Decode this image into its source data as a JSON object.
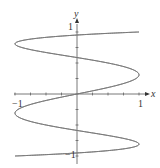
{
  "chart_data": {
    "type": "line",
    "title": "",
    "xlabel": "x",
    "ylabel": "y",
    "xlim": [
      -1,
      1
    ],
    "ylim": [
      -1,
      1
    ],
    "x_tick_labels": [
      "-1",
      "1"
    ],
    "y_tick_labels": [
      "1",
      "-1"
    ],
    "grid": false,
    "series": [
      {
        "name": "parametric curve x = sin(5t), y = sin(t)",
        "param": "t in [0, 2π]",
        "color": "#777777"
      }
    ]
  },
  "labels": {
    "x_axis": "x",
    "y_axis": "y",
    "x_neg": "−1",
    "x_pos": "1",
    "y_pos": "1",
    "y_neg": "−1"
  }
}
